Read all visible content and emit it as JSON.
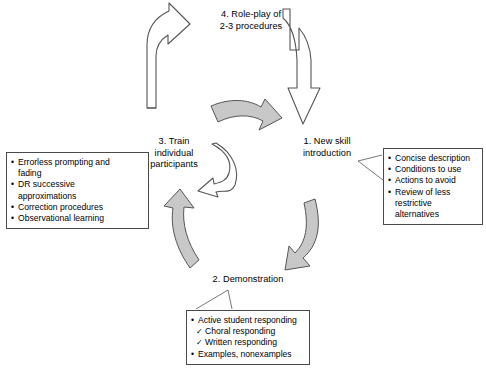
{
  "diagram": {
    "colors": {
      "arrow_fill_gray": "#c8c8c8",
      "arrow_stroke": "#555555",
      "arrow_fill_white": "#ffffff",
      "box_border": "#4a4a4a",
      "text": "#000000",
      "background": "#ffffff"
    },
    "stages": [
      {
        "id": "stage-1",
        "label": "1. New skill\nintroduction"
      },
      {
        "id": "stage-2",
        "label": "2. Demonstration"
      },
      {
        "id": "stage-3",
        "label": "3. Train\nindividual\nparticipants"
      },
      {
        "id": "stage-4",
        "label": "4. Role-play of\n2-3 procedures"
      }
    ],
    "boxes": {
      "skill_intro": {
        "items": [
          {
            "marker": "•",
            "type": "bullet",
            "text": "Concise description"
          },
          {
            "marker": "•",
            "type": "bullet",
            "text": "Conditions to use"
          },
          {
            "marker": "•",
            "type": "bullet",
            "text": "Actions to avoid"
          },
          {
            "marker": "•",
            "type": "bullet",
            "text": "Review of less"
          },
          {
            "marker": "",
            "type": "cont",
            "text": "restrictive alternatives"
          }
        ]
      },
      "training": {
        "items": [
          {
            "marker": "•",
            "type": "bullet",
            "text": "Errorless prompting and"
          },
          {
            "marker": "",
            "type": "cont",
            "text": "fading"
          },
          {
            "marker": "•",
            "type": "bullet",
            "text": "DR successive"
          },
          {
            "marker": "",
            "type": "cont",
            "text": "approximations"
          },
          {
            "marker": "•",
            "type": "bullet",
            "text": "Correction procedures"
          },
          {
            "marker": "•",
            "type": "bullet",
            "text": "Observational learning"
          }
        ]
      },
      "demonstration": {
        "items": [
          {
            "marker": "•",
            "type": "bullet",
            "text": "Active student responding"
          },
          {
            "marker": "✓",
            "type": "check",
            "text": "Choral responding"
          },
          {
            "marker": "✓",
            "type": "check",
            "text": "Written responding"
          },
          {
            "marker": "•",
            "type": "bullet",
            "text": "Examples, nonexamples"
          }
        ]
      }
    },
    "arrows": [
      {
        "id": "arrow-stage4-to-stage1",
        "style": "white-outline",
        "direction": "down-right"
      },
      {
        "id": "arrow-stage3-to-stage4",
        "style": "white-outline",
        "direction": "up-right"
      },
      {
        "id": "arrow-stage4-to-stage1-gray",
        "style": "gray-filled",
        "direction": "right"
      },
      {
        "id": "arrow-stage1-to-stage2",
        "style": "gray-filled",
        "direction": "down-left"
      },
      {
        "id": "arrow-stage2-to-stage3",
        "style": "gray-filled",
        "direction": "up"
      },
      {
        "id": "arrow-inner-loop",
        "style": "white-outline",
        "direction": "counter-clockwise"
      }
    ]
  }
}
